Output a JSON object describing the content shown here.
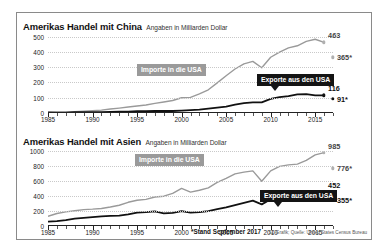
{
  "figure": {
    "footnote": "*Stand September 2017",
    "source": "SZ-Grafik; Quelle: United States Census Bureau"
  },
  "chart_data": [
    {
      "type": "line",
      "title": "Amerikas Handel mit China",
      "subtitle": "Angaben in Milliarden Dollar",
      "xlabel": "",
      "ylabel": "Angaben in Milliarden Dollar",
      "xlim": [
        1985,
        2017
      ],
      "ylim": [
        0,
        550
      ],
      "yticks": [
        0,
        100,
        200,
        300,
        400,
        500
      ],
      "ytick_labels": [
        "0",
        "100",
        "200",
        "300",
        "400",
        "500"
      ],
      "xticks": [
        1985,
        1990,
        1995,
        2000,
        2005,
        2010,
        2015
      ],
      "xtick_labels": [
        "1985",
        "1990",
        "1995",
        "2000",
        "2005",
        "2010",
        "2015"
      ],
      "grid": "horizontal-dotted",
      "legend": "inline-annotations",
      "annotations": [
        {
          "text": "Importe in die USA",
          "style": "grey-badge"
        },
        {
          "text": "Exporte aus den USA",
          "style": "black-badge"
        }
      ],
      "series": [
        {
          "name": "Importe in die USA",
          "color": "#9a9a9a",
          "x": [
            1985,
            1986,
            1987,
            1988,
            1989,
            1990,
            1991,
            1992,
            1993,
            1994,
            1995,
            1996,
            1997,
            1998,
            1999,
            2000,
            2001,
            2002,
            2003,
            2004,
            2005,
            2006,
            2007,
            2008,
            2009,
            2010,
            2011,
            2012,
            2013,
            2014,
            2015,
            2016
          ],
          "values": [
            4,
            5,
            6,
            9,
            12,
            15,
            19,
            26,
            32,
            39,
            46,
            52,
            63,
            72,
            82,
            100,
            102,
            125,
            152,
            197,
            244,
            288,
            322,
            338,
            296,
            365,
            399,
            426,
            440,
            469,
            483,
            463
          ],
          "end_label": "463",
          "end_value": 463,
          "partial_2017": {
            "label": "365*",
            "value": 365
          }
        },
        {
          "name": "Exporte aus den USA",
          "color": "#111111",
          "x": [
            1985,
            1986,
            1987,
            1988,
            1989,
            1990,
            1991,
            1992,
            1993,
            1994,
            1995,
            1996,
            1997,
            1998,
            1999,
            2000,
            2001,
            2002,
            2003,
            2004,
            2005,
            2006,
            2007,
            2008,
            2009,
            2010,
            2011,
            2012,
            2013,
            2014,
            2015,
            2016
          ],
          "values": [
            4,
            3,
            3,
            5,
            6,
            5,
            6,
            7,
            9,
            9,
            12,
            12,
            13,
            14,
            13,
            16,
            19,
            22,
            28,
            35,
            42,
            55,
            65,
            70,
            70,
            92,
            104,
            111,
            122,
            124,
            116,
            116
          ],
          "end_label": "116",
          "end_value": 116,
          "partial_2017": {
            "label": "91*",
            "value": 91
          }
        }
      ]
    },
    {
      "type": "line",
      "title": "Amerikas Handel mit Asien",
      "subtitle": "Angaben in Milliarden Dollar",
      "xlabel": "",
      "ylabel": "Angaben in Milliarden Dollar",
      "xlim": [
        1985,
        2017
      ],
      "ylim": [
        0,
        1100
      ],
      "yticks": [
        0,
        200,
        400,
        600,
        800,
        1000
      ],
      "ytick_labels": [
        "0",
        "200",
        "400",
        "600",
        "800",
        "1000"
      ],
      "xticks": [
        1985,
        1990,
        1995,
        2000,
        2005,
        2010,
        2015
      ],
      "xtick_labels": [
        "1985",
        "1990",
        "1995",
        "2000",
        "2005",
        "2010",
        "2015"
      ],
      "grid": "horizontal-dotted",
      "legend": "inline-annotations",
      "annotations": [
        {
          "text": "Importe in die USA",
          "style": "grey-badge"
        },
        {
          "text": "Exporte aus den USA",
          "style": "black-badge"
        }
      ],
      "series": [
        {
          "name": "Importe in die USA",
          "color": "#9a9a9a",
          "x": [
            1985,
            1986,
            1987,
            1988,
            1989,
            1990,
            1991,
            1992,
            1993,
            1994,
            1995,
            1996,
            1997,
            1998,
            1999,
            2000,
            2001,
            2002,
            2003,
            2004,
            2005,
            2006,
            2007,
            2008,
            2009,
            2010,
            2011,
            2012,
            2013,
            2014,
            2015,
            2016
          ],
          "values": [
            130,
            168,
            190,
            205,
            220,
            226,
            235,
            255,
            278,
            318,
            345,
            357,
            389,
            400,
            437,
            505,
            455,
            480,
            512,
            585,
            640,
            700,
            722,
            740,
            600,
            740,
            800,
            820,
            830,
            880,
            955,
            985
          ],
          "end_label": "985",
          "end_value": 985,
          "partial_2017": {
            "label": "776*",
            "value": 776
          }
        },
        {
          "name": "Exporte aus den USA",
          "color": "#111111",
          "x": [
            1985,
            1986,
            1987,
            1988,
            1989,
            1990,
            1991,
            1992,
            1993,
            1994,
            1995,
            1996,
            1997,
            1998,
            1999,
            2000,
            2001,
            2002,
            2003,
            2004,
            2005,
            2006,
            2007,
            2008,
            2009,
            2010,
            2011,
            2012,
            2013,
            2014,
            2015,
            2016
          ],
          "values": [
            60,
            65,
            78,
            98,
            110,
            118,
            128,
            135,
            140,
            155,
            180,
            186,
            195,
            170,
            175,
            200,
            180,
            185,
            200,
            225,
            250,
            280,
            310,
            340,
            290,
            360,
            410,
            425,
            435,
            450,
            445,
            452
          ],
          "end_label": "452",
          "end_value": 452,
          "partial_2017": {
            "label": "355*",
            "value": 355
          }
        }
      ]
    }
  ]
}
